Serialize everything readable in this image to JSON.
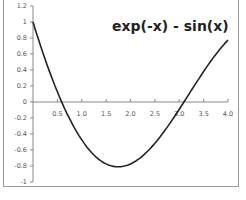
{
  "chart_data": {
    "type": "line",
    "title": "exp(-x) - sin(x)",
    "xlabel": "",
    "ylabel": "",
    "xlim": [
      0,
      4.0
    ],
    "ylim": [
      -1,
      1.2
    ],
    "grid": false,
    "legend": "none",
    "x_ticks": [
      "0.5",
      "1.0",
      "1.5",
      "2.0",
      "2.5",
      "3.0",
      "3.5",
      "4.0"
    ],
    "y_ticks": [
      "1.2",
      "1",
      "0.8",
      "0.6",
      "0.4",
      "0.2",
      "0",
      "-0.2",
      "-0.4",
      "-0.6",
      "-0.8",
      "-1"
    ],
    "series": [
      {
        "name": "exp(-x) - sin(x)",
        "color": "#222222",
        "x": [
          0,
          0.25,
          0.5,
          0.75,
          1.0,
          1.25,
          1.5,
          1.75,
          2.0,
          2.25,
          2.5,
          2.75,
          3.0,
          3.25,
          3.5,
          3.75,
          4.0
        ],
        "values": [
          1.0,
          0.531,
          0.127,
          -0.209,
          -0.473,
          -0.662,
          -0.774,
          -0.81,
          -0.774,
          -0.673,
          -0.516,
          -0.318,
          -0.091,
          0.147,
          0.381,
          0.595,
          0.775
        ]
      }
    ]
  }
}
